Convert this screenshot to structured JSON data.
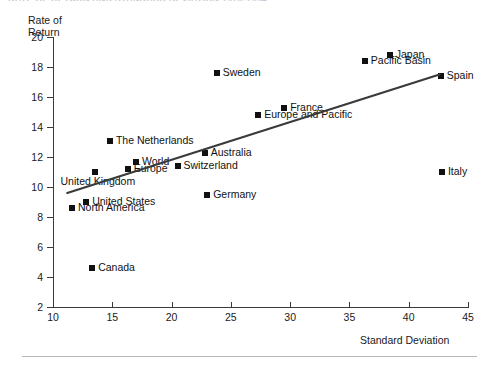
{
  "figure": {
    "title_remnant": "RATE OF RETURN AND STANDARD DEVIATION 1970-1994",
    "ylabel_line1": "Rate of",
    "ylabel_line2": "Return",
    "xlabel": "Standard Deviation"
  },
  "chart_data": {
    "type": "scatter",
    "title": "",
    "xlabel": "Standard Deviation",
    "ylabel": "Rate of Return",
    "xlim": [
      10,
      45
    ],
    "ylim": [
      2,
      20
    ],
    "xticks": [
      10,
      15,
      20,
      25,
      30,
      35,
      40,
      45
    ],
    "yticks": [
      2,
      4,
      6,
      8,
      10,
      12,
      14,
      16,
      18,
      20
    ],
    "grid": false,
    "legend": "none",
    "marker": "filled-square",
    "marker_color": "#111111",
    "trendline": {
      "visible": true,
      "color": "#3a3a3a",
      "x_start": 11.2,
      "y_start": 9.6,
      "x_end": 42.6,
      "y_end": 17.5
    },
    "points": [
      {
        "label": "Canada",
        "x": 13.3,
        "y": 4.6,
        "label_pos": "right"
      },
      {
        "label": "North America",
        "x": 11.6,
        "y": 8.6,
        "label_pos": "right"
      },
      {
        "label": "United States",
        "x": 12.8,
        "y": 9.0,
        "label_pos": "right"
      },
      {
        "label": "United Kingdom",
        "x": 13.5,
        "y": 11.0,
        "label_pos": "below"
      },
      {
        "label": "The Netherlands",
        "x": 14.8,
        "y": 13.1,
        "label_pos": "right"
      },
      {
        "label": "Europe",
        "x": 16.3,
        "y": 11.2,
        "label_pos": "right"
      },
      {
        "label": "World",
        "x": 17.0,
        "y": 11.7,
        "label_pos": "right"
      },
      {
        "label": "Switzerland",
        "x": 20.5,
        "y": 11.4,
        "label_pos": "right"
      },
      {
        "label": "Australia",
        "x": 22.8,
        "y": 12.3,
        "label_pos": "right"
      },
      {
        "label": "Germany",
        "x": 23.0,
        "y": 9.5,
        "label_pos": "right"
      },
      {
        "label": "Sweden",
        "x": 23.8,
        "y": 17.6,
        "label_pos": "right"
      },
      {
        "label": "Europe and Pacific",
        "x": 27.3,
        "y": 14.8,
        "label_pos": "right"
      },
      {
        "label": "France",
        "x": 29.5,
        "y": 15.3,
        "label_pos": "right"
      },
      {
        "label": "Pacific Basin",
        "x": 36.3,
        "y": 18.4,
        "label_pos": "right"
      },
      {
        "label": "Japan",
        "x": 38.4,
        "y": 18.8,
        "label_pos": "right"
      },
      {
        "label": "Spain",
        "x": 42.7,
        "y": 17.4,
        "label_pos": "right"
      },
      {
        "label": "Italy",
        "x": 42.8,
        "y": 11.0,
        "label_pos": "right"
      }
    ]
  }
}
